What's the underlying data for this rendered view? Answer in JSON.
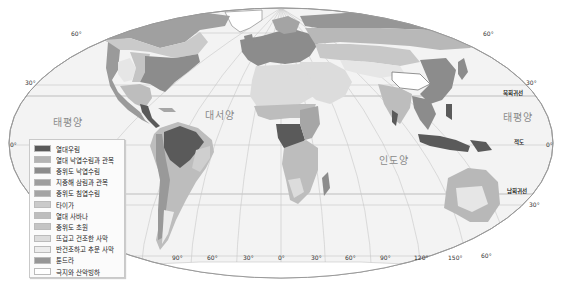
{
  "map": {
    "title": "",
    "projection": "Robinson-like world map, climate/vegetation zones",
    "oceans": [
      {
        "id": "pacific-west",
        "label": "태평양"
      },
      {
        "id": "atlantic",
        "label": "대서양"
      },
      {
        "id": "indian",
        "label": "인도양"
      },
      {
        "id": "pacific-east",
        "label": "태평양"
      }
    ],
    "latitude_labels": {
      "lat60n_left": "60°",
      "lat60n_right": "60°",
      "lat30n_left": "30°",
      "lat30n_right": "30°",
      "lat0_left": "0°",
      "lat0_right": "0°",
      "lat30s_right": "30°",
      "lat60s_right": "60°"
    },
    "special_lines": {
      "tropic_of_cancer": "북회귀선",
      "equator": "적도",
      "tropic_of_capricorn": "남회귀선"
    },
    "longitude_labels": [
      "90°",
      "60°",
      "30°",
      "0°",
      "30°",
      "60°",
      "90°",
      "120°",
      "150°"
    ]
  },
  "legend": {
    "items": [
      {
        "label": "열대우림",
        "color": "#5a5a5a"
      },
      {
        "label": "열대 낙엽수림과 관목",
        "color": "#b4b4b4"
      },
      {
        "label": "중위도 낙엽수림",
        "color": "#8c8c8c"
      },
      {
        "label": "지중해 삼림과 관목",
        "color": "#9e9e9e"
      },
      {
        "label": "중위도 침엽수림",
        "color": "#a4a4a4"
      },
      {
        "label": "타이가",
        "color": "#cacaca"
      },
      {
        "label": "열대 사바나",
        "color": "#bdbdbd"
      },
      {
        "label": "중위도 초원",
        "color": "#c4c4c4"
      },
      {
        "label": "뜨겁고 건조한 사막",
        "color": "#dcdcdc"
      },
      {
        "label": "반건조하고 추운 사막",
        "color": "#ececec"
      },
      {
        "label": "툰드라",
        "color": "#969696"
      },
      {
        "label": "극지와 산악빙하",
        "color": "#ffffff"
      }
    ]
  }
}
